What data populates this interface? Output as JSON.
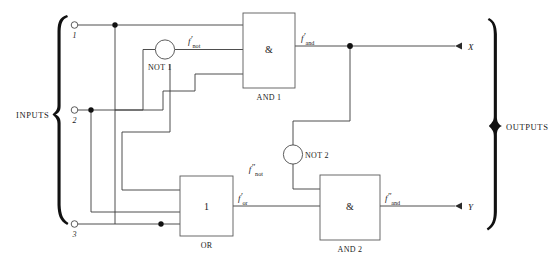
{
  "diagram": {
    "width": 552,
    "height": 265,
    "background_color": "#ffffff",
    "wire_color": "#3a3a3a",
    "text_color": "#1a1a1a"
  },
  "groups": {
    "inputs_label": "INPUTS",
    "outputs_label": "OUTPUTS"
  },
  "inputs": [
    {
      "id": "in1",
      "label": "1"
    },
    {
      "id": "in2",
      "label": "2"
    },
    {
      "id": "in3",
      "label": "3"
    }
  ],
  "outputs": [
    {
      "id": "out_x",
      "label": "X"
    },
    {
      "id": "out_y",
      "label": "Y"
    }
  ],
  "gates": [
    {
      "id": "not1",
      "name": "NOT 1",
      "symbol": "",
      "type": "not"
    },
    {
      "id": "not2",
      "name": "NOT 2",
      "symbol": "",
      "type": "not"
    },
    {
      "id": "and1",
      "name": "AND 1",
      "symbol": "&",
      "type": "and"
    },
    {
      "id": "and2",
      "name": "AND 2",
      "symbol": "&",
      "type": "and"
    },
    {
      "id": "or1",
      "name": "OR",
      "symbol": "1",
      "type": "or"
    }
  ],
  "signals": [
    {
      "id": "f_not_1",
      "base": "f",
      "primes": "′",
      "subscript": "not"
    },
    {
      "id": "f_and_1",
      "base": "f",
      "primes": "′",
      "subscript": "and"
    },
    {
      "id": "f_not_2",
      "base": "f",
      "primes": "″",
      "subscript": "not"
    },
    {
      "id": "f_or",
      "base": "f",
      "primes": "′",
      "subscript": "or"
    },
    {
      "id": "f_and_2",
      "base": "f",
      "primes": "″",
      "subscript": "and"
    }
  ]
}
